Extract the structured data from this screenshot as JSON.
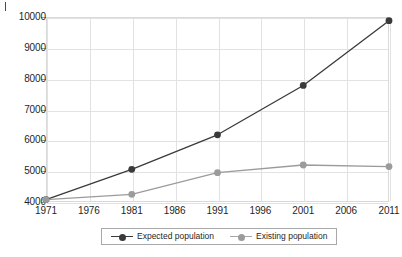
{
  "chart_data": {
    "type": "line",
    "title": "",
    "subtitle": "",
    "xlabel": "",
    "ylabel": "",
    "x": [
      1971,
      1976,
      1981,
      1986,
      1991,
      1996,
      2001,
      2006,
      2011
    ],
    "xtick_labels": [
      "1971",
      "1976",
      "1981",
      "1986",
      "1991",
      "1996",
      "2001",
      "2006",
      "2011"
    ],
    "xlim": [
      1971,
      2011
    ],
    "ylim": [
      4000,
      10000
    ],
    "ytick_labels": [
      "4000",
      "5000",
      "6000",
      "7000",
      "8000",
      "9000",
      "10000"
    ],
    "yticks": [
      4000,
      5000,
      6000,
      7000,
      8000,
      9000,
      10000
    ],
    "grid": true,
    "legend_position": "bottom-center",
    "series": [
      {
        "name": "Expected population",
        "color": "#3a3a3a",
        "marker": "circle",
        "x": [
          1971,
          1981,
          1991,
          2001,
          2011
        ],
        "values": [
          4080,
          5060,
          6180,
          7780,
          9880
        ]
      },
      {
        "name": "Existing population",
        "color": "#9b9b9b",
        "marker": "circle",
        "x": [
          1971,
          1981,
          1991,
          2001,
          2011
        ],
        "values": [
          4080,
          4250,
          4950,
          5200,
          5150
        ]
      }
    ]
  },
  "legend": {
    "items": [
      {
        "label": "Expected population",
        "color": "#3a3a3a"
      },
      {
        "label": "Existing population",
        "color": "#9b9b9b"
      }
    ]
  },
  "colors": {
    "expected": "#3a3a3a",
    "existing": "#9b9b9b",
    "grid": "#e2e2e2",
    "frame": "#d9d9d9",
    "text": "#1f1f1f",
    "background": "#ffffff"
  }
}
